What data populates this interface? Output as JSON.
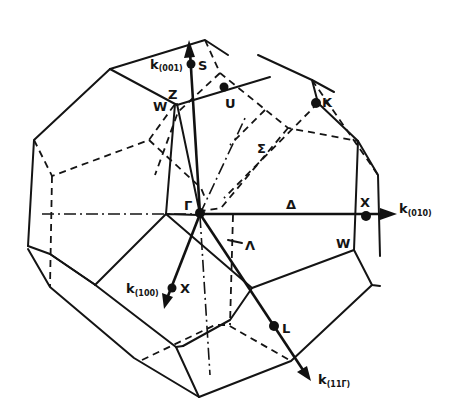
{
  "figure": {
    "colors": {
      "line": "#141414",
      "background": "#ffffff"
    }
  },
  "axes": {
    "k001": {
      "k": "k",
      "sub": "(001)"
    },
    "k010": {
      "k": "k",
      "sub": "(010)"
    },
    "k100": {
      "k": "k",
      "sub": "(100)"
    },
    "k111": {
      "k": "k",
      "sub": "(11Γ)"
    }
  },
  "points": {
    "gamma": "Γ",
    "S": "S",
    "U": "U",
    "K": "K",
    "Z": "Z",
    "W_top": "W",
    "W_right": "W",
    "X_right": "X",
    "X_bottom": "X",
    "L": "L"
  },
  "lines": {
    "sigma": "Σ",
    "delta": "Δ",
    "lambda": "Λ"
  }
}
